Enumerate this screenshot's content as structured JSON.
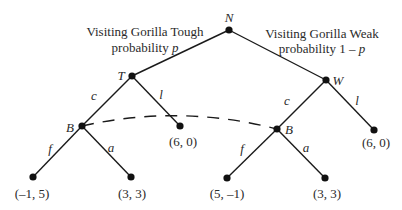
{
  "diagram": {
    "type": "extensive-form game tree",
    "root": {
      "label": "N"
    },
    "branches": {
      "tough": {
        "title_line1": "Visiting Gorilla Tough",
        "title_line2_text": "probability ",
        "title_line2_var": "p"
      },
      "weak": {
        "title_line1": "Visiting Gorilla Weak",
        "title_line2_text": "probability 1 – ",
        "title_line2_var": "p"
      }
    },
    "nodes": {
      "N": "N",
      "T": "T",
      "W": "W",
      "B_left": "B",
      "B_right": "B"
    },
    "actions": {
      "T_c": "c",
      "T_l": "l",
      "W_c": "c",
      "W_l": "l",
      "BL_f": "f",
      "BL_a": "a",
      "BR_f": "f",
      "BR_a": "a"
    },
    "payoffs": {
      "T_l": "(6, 0)",
      "W_l": "(6, 0)",
      "BL_f": "(–1, 5)",
      "BL_a": "(3, 3)",
      "BR_f": "(5, –1)",
      "BR_a": "(3, 3)"
    },
    "information_set": {
      "connects": [
        "B_left",
        "B_right"
      ],
      "style": "dashed"
    }
  }
}
